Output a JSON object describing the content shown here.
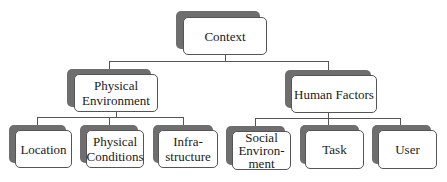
{
  "diagram": {
    "type": "hierarchy",
    "colors": {
      "shadow": "#6e6e6e",
      "border": "#555555",
      "background": "#ffffff",
      "text": "#1a1a1a"
    },
    "root": {
      "label": "Context"
    },
    "level1": [
      {
        "label": "Physical Environment",
        "children": [
          {
            "label": "Location"
          },
          {
            "label": "Physical Conditions"
          },
          {
            "label": "Infra-structure"
          }
        ]
      },
      {
        "label": "Human Factors",
        "children": [
          {
            "label": "Social Environ-ment"
          },
          {
            "label": "Task"
          },
          {
            "label": "User"
          }
        ]
      }
    ],
    "display": {
      "context": "Context",
      "physical_env_1": "Physical",
      "physical_env_2": "Environment",
      "human_factors": "Human Factors",
      "location": "Location",
      "phys_cond_1": "Physical",
      "phys_cond_2": "Conditions",
      "infra_1": "Infra-",
      "infra_2": "structure",
      "social_1": "Social",
      "social_2": "Environ-",
      "social_3": "ment",
      "task": "Task",
      "user": "User"
    }
  }
}
